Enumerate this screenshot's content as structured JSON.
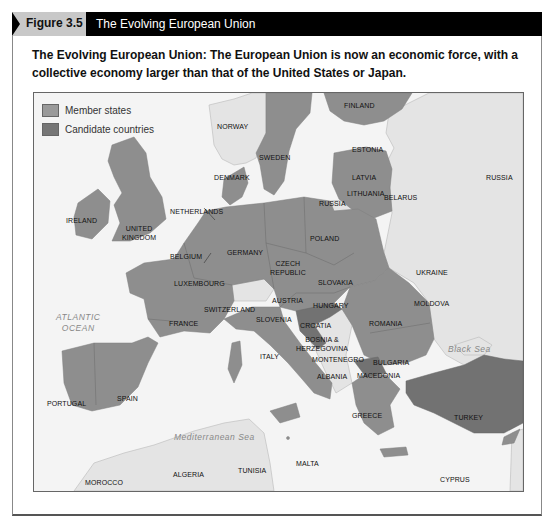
{
  "header": {
    "figure_label": "Figure 3.5",
    "title": "The Evolving European Union"
  },
  "caption": "The Evolving European Union: The European Union is now an economic force, with a collective economy larger than that of the United States or Japan.",
  "colors": {
    "member_states": "#8e8e8e",
    "candidate_countries": "#727272",
    "non_member_land": "#e4e4e4",
    "sea": "#f4f4f4",
    "header_bg": "#000000",
    "figure_tab_bg": "#c8c8c8"
  },
  "legend": [
    {
      "label": "Member states",
      "color": "#9a9a9a"
    },
    {
      "label": "Candidate countries",
      "color": "#767676"
    }
  ],
  "map": {
    "member_states": [
      "Finland",
      "Sweden",
      "Estonia",
      "Latvia",
      "Lithuania",
      "Denmark",
      "Ireland",
      "United Kingdom",
      "Netherlands",
      "Belgium",
      "Luxembourg",
      "Germany",
      "Poland",
      "Czech Republic",
      "Slovakia",
      "Austria",
      "Hungary",
      "Slovenia",
      "France",
      "Italy",
      "Romania",
      "Bulgaria",
      "Portugal",
      "Spain",
      "Greece",
      "Malta",
      "Cyprus"
    ],
    "candidate_countries": [
      "Croatia",
      "Macedonia",
      "Turkey"
    ],
    "non_members": [
      "Norway",
      "Russia",
      "Belarus",
      "Ukraine",
      "Moldova",
      "Switzerland",
      "Bosnia & Herzegovina",
      "Montenegro",
      "Albania",
      "Algeria",
      "Tunisia",
      "Morocco"
    ],
    "labels": {
      "finland": "FINLAND",
      "norway": "NORWAY",
      "sweden": "SWEDEN",
      "estonia": "ESTONIA",
      "latvia": "LATVIA",
      "lithuania": "LITHUANIA",
      "russia_east": "RUSSIA",
      "russia_kaliningrad": "RUSSIA",
      "denmark": "DENMARK",
      "ireland": "IRELAND",
      "united_kingdom_1": "UNITED",
      "united_kingdom_2": "KINGDOM",
      "netherlands": "NETHERLANDS",
      "belarus": "BELARUS",
      "poland": "POLAND",
      "germany": "GERMANY",
      "belgium": "BELGIUM",
      "czech_1": "CZECH",
      "czech_2": "REPUBLIC",
      "ukraine": "UKRAINE",
      "luxembourg": "LUXEMBOURG",
      "slovakia": "SLOVAKIA",
      "austria": "AUSTRIA",
      "hungary": "HUNGARY",
      "moldova": "MOLDOVA",
      "switzerland": "SWITZERLAND",
      "slovenia": "SLOVENIA",
      "croatia": "CROATIA",
      "romania": "ROMANIA",
      "france": "FRANCE",
      "bosnia_1": "BOSNIA &",
      "bosnia_2": "HERZEGOVINA",
      "italy": "ITALY",
      "montenegro": "MONTENEGRO",
      "bulgaria": "BULGARIA",
      "albania": "ALBANIA",
      "macedonia": "MACEDONIA",
      "portugal": "PORTUGAL",
      "spain": "SPAIN",
      "greece": "GREECE",
      "turkey": "TURKEY",
      "malta": "MALTA",
      "algeria": "ALGERIA",
      "tunisia": "TUNISIA",
      "morocco": "MOROCCO",
      "cyprus": "CYPRUS"
    },
    "water_labels": {
      "atlantic_1": "ATLANTIC",
      "atlantic_2": "OCEAN",
      "black_sea": "Black Sea",
      "mediterranean": "Mediterranean Sea"
    }
  }
}
